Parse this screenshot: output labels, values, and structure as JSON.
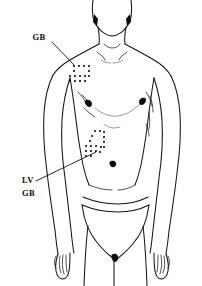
{
  "figure": {
    "view": "anterior"
  },
  "labels": [
    {
      "id": "gb-upper",
      "text": "GB",
      "meaning": "Gall Bladder",
      "x": 39,
      "y": 40,
      "leader_from": [
        52,
        42
      ],
      "leader_to": [
        74,
        65
      ],
      "points_to": "supraclavicular-dot-zone"
    },
    {
      "id": "lv-lower",
      "text": "LV",
      "meaning": "Liver",
      "x": 22,
      "y": 183,
      "leader_from": [
        36,
        181
      ],
      "leader_to": [
        96,
        152
      ],
      "points_to": "hypochondriac-dot-zone"
    },
    {
      "id": "gb-lower",
      "text": "GB",
      "meaning": "Gall Bladder",
      "x": 22,
      "y": 196,
      "leader_from": null,
      "leader_to": null,
      "points_to": "hypochondriac-dot-zone"
    }
  ],
  "dot_zones": [
    {
      "id": "supraclavicular-dot-zone",
      "region": "left supraclavicular / shoulder",
      "label_ref": "GB",
      "dot_radius": 1.0,
      "dots": [
        [
          74,
          66
        ],
        [
          79,
          66
        ],
        [
          84,
          66
        ],
        [
          89,
          66
        ],
        [
          74,
          71
        ],
        [
          89,
          71
        ],
        [
          70,
          76
        ],
        [
          75,
          76
        ],
        [
          80,
          76
        ],
        [
          85,
          76
        ],
        [
          89,
          76
        ],
        [
          70,
          81
        ],
        [
          75,
          81
        ],
        [
          80,
          81
        ],
        [
          85,
          81
        ]
      ]
    },
    {
      "id": "hypochondriac-dot-zone",
      "region": "left hypochondrium / lower ribs",
      "label_ref": "LV GB",
      "dot_radius": 1.0,
      "dots": [
        [
          95,
          131
        ],
        [
          100,
          131
        ],
        [
          104,
          132
        ],
        [
          92,
          136
        ],
        [
          104,
          137
        ],
        [
          90,
          141
        ],
        [
          104,
          142
        ],
        [
          86,
          146
        ],
        [
          91,
          146
        ],
        [
          96,
          146
        ],
        [
          101,
          147
        ],
        [
          104,
          147
        ],
        [
          86,
          151
        ],
        [
          91,
          151
        ],
        [
          96,
          151
        ],
        [
          100,
          152
        ],
        [
          86,
          156
        ],
        [
          91,
          156
        ]
      ]
    }
  ],
  "anatomy_marks": [
    {
      "name": "left-sternocleidomastoid-shadow",
      "x": 95,
      "y": 24
    },
    {
      "name": "right-sternocleidomastoid-shadow",
      "x": 127,
      "y": 24
    },
    {
      "name": "suprasternal-notch",
      "x": 111,
      "y": 46
    },
    {
      "name": "left-nipple",
      "x": 79,
      "y": 102
    },
    {
      "name": "right-nipple",
      "x": 143,
      "y": 100
    },
    {
      "name": "navel",
      "x": 113,
      "y": 164
    },
    {
      "name": "left-hand",
      "x": 55,
      "y": 258
    },
    {
      "name": "right-hand",
      "x": 160,
      "y": 258
    }
  ],
  "colors": {
    "background": "#ffffff",
    "outline": "#141414",
    "dot": "#0a0a0a",
    "label_text": "#0d0d0d",
    "leader_line": "#101010"
  }
}
